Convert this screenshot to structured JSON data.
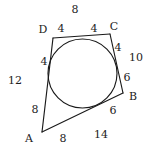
{
  "figure": {
    "stroke_color": "#1a1a1a",
    "background_color": "#ffffff",
    "vertices": [
      {
        "name": "A",
        "label": "A",
        "x": 42,
        "y": 132,
        "label_x": 29,
        "label_y": 138
      },
      {
        "name": "B",
        "label": "B",
        "x": 123,
        "y": 93,
        "label_x": 133,
        "label_y": 96
      },
      {
        "name": "C",
        "label": "C",
        "x": 110,
        "y": 34,
        "label_x": 114,
        "label_y": 26
      },
      {
        "name": "D",
        "label": "D",
        "x": 53,
        "y": 38,
        "label_x": 43,
        "label_y": 29
      }
    ],
    "circle": {
      "cx": 82.5,
      "cy": 73.5,
      "r": 34.5
    },
    "segment_labels": [
      {
        "name": "top-side-total",
        "text": "8",
        "x": 75,
        "y": 9
      },
      {
        "name": "dp-tangent",
        "text": "4",
        "x": 61,
        "y": 28
      },
      {
        "name": "pc-tangent",
        "text": "4",
        "x": 94,
        "y": 28
      },
      {
        "name": "cq-tangent",
        "text": "4",
        "x": 118,
        "y": 47
      },
      {
        "name": "right-side-total",
        "text": "10",
        "x": 136,
        "y": 57
      },
      {
        "name": "qb-tangent",
        "text": "6",
        "x": 127,
        "y": 77
      },
      {
        "name": "br-tangent",
        "text": "6",
        "x": 113,
        "y": 110
      },
      {
        "name": "bottom-side-total",
        "text": "14",
        "x": 101,
        "y": 134
      },
      {
        "name": "ra-tangent",
        "text": "8",
        "x": 63,
        "y": 138
      },
      {
        "name": "as-tangent",
        "text": "8",
        "x": 35,
        "y": 109
      },
      {
        "name": "left-side-total",
        "text": "12",
        "x": 15,
        "y": 80
      },
      {
        "name": "sd-tangent",
        "text": "4",
        "x": 44,
        "y": 61
      }
    ],
    "edges": [
      {
        "name": "edge-DC",
        "from": "D",
        "to": "C"
      },
      {
        "name": "edge-CB",
        "from": "C",
        "to": "B"
      },
      {
        "name": "edge-BA",
        "from": "B",
        "to": "A"
      },
      {
        "name": "edge-AD",
        "from": "A",
        "to": "D"
      }
    ]
  }
}
